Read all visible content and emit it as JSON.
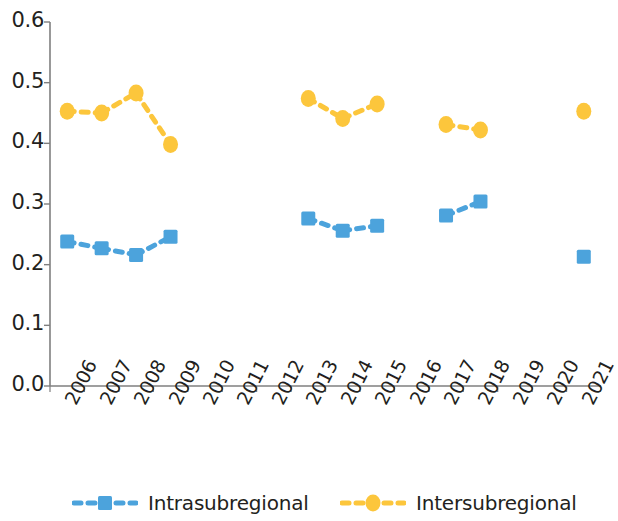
{
  "chart_data": {
    "type": "line",
    "title": "",
    "xlabel": "",
    "ylabel": "",
    "categories": [
      "2006",
      "2007",
      "2008",
      "2009",
      "2010",
      "2011",
      "2012",
      "2013",
      "2014",
      "2015",
      "2016",
      "2017",
      "2018",
      "2019",
      "2020",
      "2021"
    ],
    "ylim": [
      0.0,
      0.6
    ],
    "yticks": [
      0.0,
      0.1,
      0.2,
      0.3,
      0.4,
      0.5,
      0.6
    ],
    "ytick_labels": [
      "0.0",
      "0.1",
      "0.2",
      "0.3",
      "0.4",
      "0.5",
      "0.6"
    ],
    "grid": false,
    "legend_position": "bottom",
    "line_style": "dashed",
    "series": [
      {
        "name": "Intrasubregional",
        "color": "#4CA3DC",
        "marker": "square",
        "values": [
          0.238,
          0.227,
          0.216,
          0.246,
          null,
          null,
          null,
          0.276,
          0.256,
          0.264,
          null,
          0.281,
          0.304,
          null,
          null,
          0.213
        ]
      },
      {
        "name": "Intersubregional",
        "color": "#FCC63C",
        "marker": "circle",
        "values": [
          0.453,
          0.45,
          0.483,
          0.398,
          null,
          null,
          null,
          0.474,
          0.441,
          0.465,
          null,
          0.431,
          0.422,
          null,
          null,
          0.453
        ]
      }
    ]
  },
  "legend": {
    "items": [
      {
        "label": "Intrasubregional",
        "color": "#4CA3DC",
        "marker": "square"
      },
      {
        "label": "Intersubregional",
        "color": "#FCC63C",
        "marker": "circle"
      }
    ]
  },
  "axis_colors": {
    "axis_line": "#7f7f7f",
    "tick": "#7f7f7f",
    "text": "#231f20"
  }
}
